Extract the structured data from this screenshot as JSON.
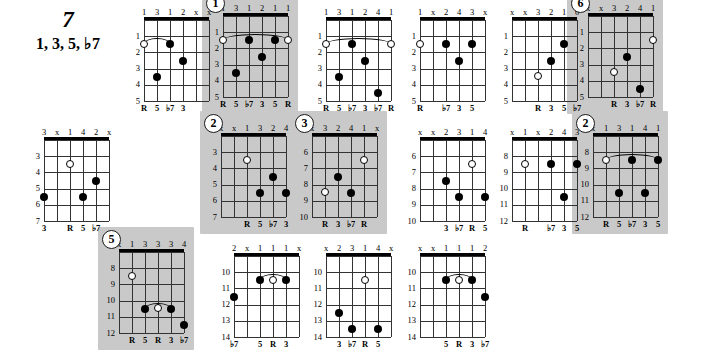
{
  "title": {
    "chord_symbol": "7",
    "formula": "1, 3, 5, ♭7"
  },
  "layout": {
    "rows": 3,
    "columns": 6
  },
  "diagrams": [
    {
      "id": "d1",
      "number": "",
      "shaded": false,
      "fingers": [
        "1",
        "3",
        "1",
        "2",
        "x",
        "x"
      ],
      "frets": [
        "1",
        "2",
        "3",
        "4",
        "5"
      ],
      "intervals": [
        "R",
        "5",
        "♭7",
        "3",
        "",
        ""
      ],
      "dots": [
        {
          "string": 1,
          "fret": 2,
          "type": "open"
        },
        {
          "string": 3,
          "fret": 2,
          "type": "filled"
        },
        {
          "string": 4,
          "fret": 3,
          "type": "filled"
        },
        {
          "string": 2,
          "fret": 4,
          "type": "filled"
        }
      ],
      "barre": {
        "fret": 2,
        "from": 1,
        "to": 3
      }
    },
    {
      "id": "d2",
      "number": "1",
      "shaded": true,
      "fingers": [
        "1",
        "3",
        "1",
        "2",
        "1",
        "1"
      ],
      "frets": [
        "1",
        "2",
        "3",
        "4",
        "5"
      ],
      "intervals": [
        "R",
        "5",
        "♭7",
        "3",
        "5",
        "R"
      ],
      "dots": [
        {
          "string": 1,
          "fret": 2,
          "type": "open"
        },
        {
          "string": 3,
          "fret": 2,
          "type": "filled"
        },
        {
          "string": 5,
          "fret": 2,
          "type": "filled"
        },
        {
          "string": 6,
          "fret": 2,
          "type": "open"
        },
        {
          "string": 4,
          "fret": 3,
          "type": "filled"
        },
        {
          "string": 2,
          "fret": 4,
          "type": "filled"
        }
      ],
      "barre": {
        "fret": 2,
        "from": 1,
        "to": 6
      }
    },
    {
      "id": "d3",
      "number": "",
      "shaded": false,
      "fingers": [
        "1",
        "3",
        "1",
        "2",
        "4",
        "1"
      ],
      "frets": [
        "1",
        "2",
        "3",
        "4",
        "5"
      ],
      "intervals": [
        "R",
        "5",
        "♭7",
        "3",
        "♭7",
        "R"
      ],
      "dots": [
        {
          "string": 1,
          "fret": 2,
          "type": "open"
        },
        {
          "string": 3,
          "fret": 2,
          "type": "filled"
        },
        {
          "string": 6,
          "fret": 2,
          "type": "open"
        },
        {
          "string": 4,
          "fret": 3,
          "type": "filled"
        },
        {
          "string": 2,
          "fret": 4,
          "type": "filled"
        },
        {
          "string": 5,
          "fret": 5,
          "type": "filled"
        }
      ],
      "barre": {
        "fret": 2,
        "from": 1,
        "to": 6
      }
    },
    {
      "id": "d4",
      "number": "",
      "shaded": false,
      "fingers": [
        "1",
        "x",
        "2",
        "4",
        "3",
        "x"
      ],
      "frets": [
        "1",
        "2",
        "3",
        "4",
        "5"
      ],
      "intervals": [
        "R",
        "",
        "♭7",
        "3",
        "5",
        ""
      ],
      "dots": [
        {
          "string": 1,
          "fret": 2,
          "type": "open"
        },
        {
          "string": 3,
          "fret": 2,
          "type": "filled"
        },
        {
          "string": 5,
          "fret": 2,
          "type": "filled"
        },
        {
          "string": 4,
          "fret": 3,
          "type": "filled"
        }
      ],
      "barre": null
    },
    {
      "id": "d5",
      "number": "",
      "shaded": false,
      "fingers": [
        "x",
        "x",
        "3",
        "2",
        "1",
        "0"
      ],
      "frets": [
        "1",
        "2",
        "3",
        "4",
        "5"
      ],
      "intervals": [
        "",
        "",
        "R",
        "3",
        "5",
        "♭7"
      ],
      "dots": [
        {
          "string": 5,
          "fret": 2,
          "type": "filled"
        },
        {
          "string": 4,
          "fret": 3,
          "type": "filled"
        },
        {
          "string": 3,
          "fret": 4,
          "type": "open"
        }
      ],
      "barre": null
    },
    {
      "id": "d6",
      "number": "6",
      "shaded": true,
      "fingers": [
        "x",
        "x",
        "3",
        "2",
        "4",
        "1"
      ],
      "frets": [
        "1",
        "2",
        "3",
        "4",
        "5"
      ],
      "intervals": [
        "",
        "",
        "R",
        "3",
        "♭7",
        "R"
      ],
      "dots": [
        {
          "string": 6,
          "fret": 2,
          "type": "open"
        },
        {
          "string": 4,
          "fret": 3,
          "type": "filled"
        },
        {
          "string": 3,
          "fret": 4,
          "type": "open"
        },
        {
          "string": 5,
          "fret": 5,
          "type": "filled"
        }
      ],
      "barre": null
    },
    {
      "id": "d7",
      "number": "",
      "shaded": false,
      "fingers": [
        "3",
        "x",
        "1",
        "4",
        "2",
        "x"
      ],
      "frets": [
        "3",
        "4",
        "5",
        "6",
        "7"
      ],
      "intervals": [
        "3",
        "",
        "R",
        "5",
        "♭7",
        ""
      ],
      "dots": [
        {
          "string": 3,
          "fret": 4,
          "type": "open"
        },
        {
          "string": 5,
          "fret": 5,
          "type": "filled"
        },
        {
          "string": 1,
          "fret": 6,
          "type": "filled"
        },
        {
          "string": 4,
          "fret": 6,
          "type": "filled"
        }
      ],
      "barre": null
    },
    {
      "id": "d8",
      "number": "2",
      "shaded": true,
      "fingers": [
        "x",
        "x",
        "1",
        "3",
        "2",
        "4"
      ],
      "frets": [
        "3",
        "4",
        "5",
        "6",
        "7"
      ],
      "intervals": [
        "",
        "",
        "R",
        "5",
        "♭7",
        "3"
      ],
      "dots": [
        {
          "string": 3,
          "fret": 4,
          "type": "open"
        },
        {
          "string": 5,
          "fret": 5,
          "type": "filled"
        },
        {
          "string": 4,
          "fret": 6,
          "type": "filled"
        },
        {
          "string": 6,
          "fret": 6,
          "type": "filled"
        }
      ],
      "barre": null
    },
    {
      "id": "d9",
      "number": "3",
      "shaded": true,
      "fingers": [
        "x",
        "3",
        "2",
        "4",
        "1",
        "x"
      ],
      "frets": [
        "6",
        "7",
        "8",
        "9",
        "10"
      ],
      "intervals": [
        "",
        "R",
        "3",
        "♭7",
        "R",
        ""
      ],
      "dots": [
        {
          "string": 5,
          "fret": 7,
          "type": "open"
        },
        {
          "string": 3,
          "fret": 8,
          "type": "filled"
        },
        {
          "string": 2,
          "fret": 9,
          "type": "open"
        },
        {
          "string": 4,
          "fret": 9,
          "type": "filled"
        }
      ],
      "barre": null
    },
    {
      "id": "d10",
      "number": "",
      "shaded": false,
      "fingers": [
        "x",
        "x",
        "2",
        "3",
        "1",
        "4"
      ],
      "frets": [
        "6",
        "7",
        "8",
        "9",
        "10"
      ],
      "intervals": [
        "",
        "",
        "3",
        "♭7",
        "R",
        "5"
      ],
      "dots": [
        {
          "string": 5,
          "fret": 7,
          "type": "open"
        },
        {
          "string": 3,
          "fret": 8,
          "type": "filled"
        },
        {
          "string": 4,
          "fret": 9,
          "type": "filled"
        },
        {
          "string": 6,
          "fret": 9,
          "type": "filled"
        }
      ],
      "barre": null
    },
    {
      "id": "d11",
      "number": "",
      "shaded": false,
      "fingers": [
        "x",
        "1",
        "x",
        "2",
        "4",
        "3"
      ],
      "frets": [
        "8",
        "9",
        "10",
        "11",
        "12"
      ],
      "intervals": [
        "",
        "R",
        "",
        "♭7",
        "3",
        "5"
      ],
      "dots": [
        {
          "string": 2,
          "fret": 9,
          "type": "open"
        },
        {
          "string": 4,
          "fret": 9,
          "type": "filled"
        },
        {
          "string": 6,
          "fret": 9,
          "type": "filled"
        },
        {
          "string": 5,
          "fret": 11,
          "type": "filled"
        }
      ],
      "barre": null
    },
    {
      "id": "d12",
      "number": "2",
      "shaded": true,
      "fingers": [
        "x",
        "1",
        "3",
        "1",
        "4",
        "1"
      ],
      "frets": [
        "8",
        "9",
        "10",
        "11",
        "12"
      ],
      "intervals": [
        "",
        "R",
        "5",
        "♭7",
        "3",
        "5"
      ],
      "dots": [
        {
          "string": 2,
          "fret": 9,
          "type": "open"
        },
        {
          "string": 4,
          "fret": 9,
          "type": "filled"
        },
        {
          "string": 6,
          "fret": 9,
          "type": "filled"
        },
        {
          "string": 3,
          "fret": 11,
          "type": "filled"
        },
        {
          "string": 5,
          "fret": 11,
          "type": "filled"
        }
      ],
      "barre": {
        "fret": 9,
        "from": 2,
        "to": 6
      }
    },
    {
      "id": "d13",
      "number": "5",
      "shaded": true,
      "fingers": [
        "x",
        "1",
        "3",
        "3",
        "3",
        "4"
      ],
      "frets": [
        "8",
        "9",
        "10",
        "11",
        "12"
      ],
      "intervals": [
        "",
        "R",
        "5",
        "R",
        "3",
        "♭7"
      ],
      "dots": [
        {
          "string": 2,
          "fret": 9,
          "type": "open"
        },
        {
          "string": 3,
          "fret": 11,
          "type": "filled"
        },
        {
          "string": 4,
          "fret": 11,
          "type": "open"
        },
        {
          "string": 5,
          "fret": 11,
          "type": "filled"
        },
        {
          "string": 6,
          "fret": 12,
          "type": "filled"
        }
      ],
      "barre": {
        "fret": 11,
        "from": 3,
        "to": 5
      }
    },
    {
      "id": "d14",
      "number": "",
      "shaded": false,
      "fingers": [
        "2",
        "x",
        "1",
        "1",
        "1",
        "x"
      ],
      "frets": [
        "10",
        "11",
        "12",
        "13",
        "14"
      ],
      "intervals": [
        "♭7",
        "",
        "5",
        "R",
        "3",
        ""
      ],
      "dots": [
        {
          "string": 3,
          "fret": 11,
          "type": "filled"
        },
        {
          "string": 4,
          "fret": 11,
          "type": "open"
        },
        {
          "string": 5,
          "fret": 11,
          "type": "filled"
        },
        {
          "string": 1,
          "fret": 12,
          "type": "filled"
        }
      ],
      "barre": {
        "fret": 11,
        "from": 3,
        "to": 5
      }
    },
    {
      "id": "d15",
      "number": "",
      "shaded": false,
      "fingers": [
        "x",
        "2",
        "3",
        "1",
        "4",
        "x"
      ],
      "frets": [
        "10",
        "11",
        "12",
        "13",
        "14"
      ],
      "intervals": [
        "",
        "3",
        "♭7",
        "R",
        "5",
        ""
      ],
      "dots": [
        {
          "string": 4,
          "fret": 11,
          "type": "open"
        },
        {
          "string": 2,
          "fret": 13,
          "type": "filled"
        },
        {
          "string": 3,
          "fret": 14,
          "type": "filled"
        },
        {
          "string": 5,
          "fret": 14,
          "type": "filled"
        }
      ],
      "barre": null
    },
    {
      "id": "d16",
      "number": "",
      "shaded": false,
      "fingers": [
        "x",
        "x",
        "1",
        "1",
        "1",
        "2"
      ],
      "frets": [
        "10",
        "11",
        "12",
        "13",
        "14"
      ],
      "intervals": [
        "",
        "",
        "5",
        "R",
        "3",
        "♭7"
      ],
      "dots": [
        {
          "string": 3,
          "fret": 11,
          "type": "filled"
        },
        {
          "string": 4,
          "fret": 11,
          "type": "open"
        },
        {
          "string": 5,
          "fret": 11,
          "type": "filled"
        },
        {
          "string": 6,
          "fret": 12,
          "type": "filled"
        }
      ],
      "barre": {
        "fret": 11,
        "from": 3,
        "to": 5
      }
    }
  ],
  "positions": [
    {
      "id": "d1",
      "x": 128,
      "y": 6
    },
    {
      "id": "d2",
      "x": 207,
      "y": 2
    },
    {
      "id": "d3",
      "x": 310,
      "y": 6
    },
    {
      "id": "d4",
      "x": 404,
      "y": 6
    },
    {
      "id": "d5",
      "x": 496,
      "y": 6
    },
    {
      "id": "d6",
      "x": 572,
      "y": 2
    },
    {
      "id": "d7",
      "x": 28,
      "y": 126
    },
    {
      "id": "d8",
      "x": 205,
      "y": 122
    },
    {
      "id": "d9",
      "x": 296,
      "y": 122
    },
    {
      "id": "d10",
      "x": 404,
      "y": 126
    },
    {
      "id": "d11",
      "x": 496,
      "y": 126
    },
    {
      "id": "d12",
      "x": 577,
      "y": 122
    },
    {
      "id": "d13",
      "x": 103,
      "y": 238
    },
    {
      "id": "d14",
      "x": 218,
      "y": 242
    },
    {
      "id": "d15",
      "x": 310,
      "y": 242
    },
    {
      "id": "d16",
      "x": 404,
      "y": 242
    }
  ],
  "style": {
    "shade_color": "#c9c9c9",
    "line_color": "#333333",
    "nut_color": "#000000",
    "dot_color": "#000000"
  }
}
